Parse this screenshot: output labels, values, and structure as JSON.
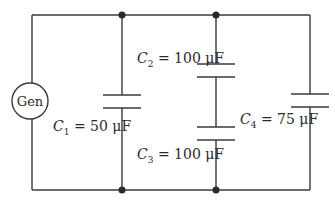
{
  "diagram": {
    "type": "circuit",
    "source": {
      "label": "Gen"
    },
    "capacitors": [
      {
        "id": "C1",
        "symbol": "C",
        "subscript": "1",
        "equals": " = ",
        "value": "50 μF"
      },
      {
        "id": "C2",
        "symbol": "C",
        "subscript": "2",
        "equals": " = ",
        "value": "100 μF"
      },
      {
        "id": "C3",
        "symbol": "C",
        "subscript": "3",
        "equals": " = ",
        "value": "100 μF"
      },
      {
        "id": "C4",
        "symbol": "C",
        "subscript": "4",
        "equals": " = ",
        "value": "75 μF"
      }
    ],
    "topology": "Generator in parallel with C1, series pair (C2, C3), and C4",
    "colors": {
      "wire": "#3a3a3a",
      "background": "#ffffff"
    }
  }
}
